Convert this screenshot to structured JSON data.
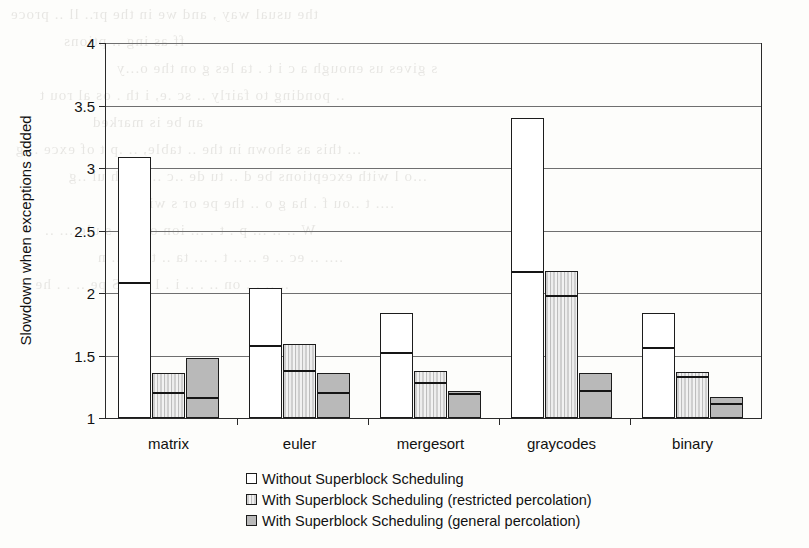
{
  "chart_data": {
    "type": "bar",
    "title": "",
    "subtitle": "",
    "xlabel": "",
    "ylabel": "Slowdown when exceptions added",
    "ylim": [
      1,
      4
    ],
    "yticks": [
      1,
      1.5,
      2,
      2.5,
      3,
      3.5,
      4
    ],
    "ytick_labels": [
      "1",
      "1.5",
      "2",
      "2.5",
      "3",
      "3.5",
      "4"
    ],
    "grid": true,
    "legend_position": "bottom-left",
    "stacked": true,
    "stack_note": "Each bar is split by a dark rule: the lower segment is the base slowdown and the upper segment is the additional slowdown; the bar top is the total value.",
    "categories": [
      "matrix",
      "euler",
      "mergesort",
      "graycodes",
      "binary"
    ],
    "series": [
      {
        "name": "Without Superblock Scheduling",
        "fill": "white",
        "color": "#ffffff",
        "values": [
          3.09,
          2.04,
          1.84,
          3.4,
          1.84
        ],
        "split_values": [
          2.08,
          1.58,
          1.52,
          2.17,
          1.56
        ]
      },
      {
        "name": "With Superblock Scheduling (restricted percolation)",
        "fill": "vertical-hatch",
        "color": "#d8d8d8",
        "values": [
          1.36,
          1.59,
          1.38,
          2.18,
          1.37
        ],
        "split_values": [
          1.2,
          1.38,
          1.28,
          1.98,
          1.33
        ]
      },
      {
        "name": "With Superblock Scheduling (general percolation)",
        "fill": "solid-gray",
        "color": "#b9b9b9",
        "values": [
          1.48,
          1.36,
          1.22,
          1.36,
          1.17
        ],
        "split_values": [
          1.16,
          1.2,
          1.19,
          1.22,
          1.11
        ]
      }
    ]
  },
  "legend": {
    "items": [
      {
        "label": "Without Superblock Scheduling",
        "swatch": "white"
      },
      {
        "label": "With Superblock Scheduling (restricted percolation)",
        "swatch": "vertical-hatch"
      },
      {
        "label": "With Superblock Scheduling (general percolation)",
        "swatch": "solid-gray"
      }
    ]
  },
  "bleed_text": [
    "the usual way , and we in the pr.. ll  ..  proce",
    "ff  as  ing   ..  ptions",
    "s  gives  us  enough  a  c  i  t  . ta  les  g   on  the  o...y",
    "  ..  ponding  to  fairly  ..  sc  .e, i th .  os  al  rou t",
    "an  be  is  marked",
    "... this  as  shown  in  the  ..  table,  ..  .p  t  of  exce  ..  g",
    "...o  l  with  exceptions  be  d  ..  tu  de  ..c  ..  d  sch  ul  ..g",
    "....  t  ..ou  f  . ha  g  o  ..  the  pe  or  s  wi  out",
    "W  ..  ..  ...  p  . t .  ... ion  of  the  s  ule  ...  ..",
    "....  ..  ec  .. e  ..  ..  t  .  ...  ta  ..  tl  so  ..  n",
    "..  ..  .  .  on  ..  .  ..  i  .  l  ..  ..  S  pe  ..  . .  he  .."
  ]
}
